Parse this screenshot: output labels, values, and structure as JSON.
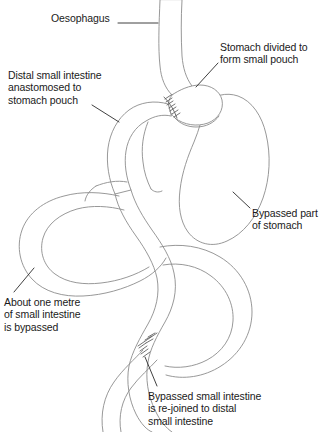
{
  "figure": {
    "type": "medical-anatomy-line-diagram",
    "background_color": "#ffffff",
    "anatomy_stroke_color": "#8c8c8c",
    "leader_stroke_color": "#2a2a2a",
    "text_color": "#1a1a1a"
  },
  "labels": {
    "oesophagus": "Oesophagus",
    "stomach_divided": "Stomach divided to\nform small pouch",
    "distal_anastomosed": "Distal small intestine\nanastomosed to\nstomach pouch",
    "bypassed_stomach": "Bypassed part\nof stomach",
    "one_metre_bypassed": "About one metre\nof small intestine\nis bypassed",
    "rejoined": "Bypassed small intestine\nis re-joined to distal\nsmall intestine"
  },
  "structures": [
    {
      "name": "oesophagus",
      "description": "Vertical tube entering from top"
    },
    {
      "name": "gastric-pouch",
      "description": "Small pouch formed from divided stomach"
    },
    {
      "name": "bypassed-stomach",
      "description": "Large rounded remnant stomach at right"
    },
    {
      "name": "roux-limb",
      "description": "Distal small intestine brought up to pouch"
    },
    {
      "name": "bypassed-small-intestine",
      "description": "Looped limb of about one metre, left side"
    },
    {
      "name": "distal-small-intestine",
      "description": "Continues to bottom of figure"
    }
  ],
  "anastomoses": [
    {
      "name": "gastrojejunostomy",
      "hatch_marks": 7,
      "location": "stomach pouch"
    },
    {
      "name": "jejunojejunostomy",
      "hatch_marks": 8,
      "location": "distal small intestine"
    }
  ]
}
